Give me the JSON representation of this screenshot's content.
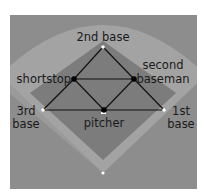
{
  "diagram": {
    "colors": {
      "page_background": "#ffffff",
      "panel_background": "#8d8d8d",
      "outfield_fan": "#a3a3a3",
      "infield_diamond": "#7a7a7a",
      "lines": "#111111",
      "base_marker": "#ffffff",
      "player_dot": "#000000",
      "label_text": "#1a1a1a"
    },
    "nodes": [
      {
        "id": "second_base",
        "label": "2nd base",
        "type": "base"
      },
      {
        "id": "shortstop",
        "label": "shortstop",
        "type": "player"
      },
      {
        "id": "second_baseman",
        "label_line1": "second",
        "label_line2": "baseman",
        "type": "player"
      },
      {
        "id": "third_base",
        "label_line1": "3rd",
        "label_line2": "base",
        "type": "base"
      },
      {
        "id": "first_base",
        "label_line1": "1st",
        "label_line2": "base",
        "type": "base"
      },
      {
        "id": "pitcher",
        "label": "pitcher",
        "type": "player"
      },
      {
        "id": "home_plate",
        "label": "",
        "type": "base"
      }
    ],
    "edges": [
      [
        "second_base",
        "shortstop"
      ],
      [
        "second_base",
        "second_baseman"
      ],
      [
        "shortstop",
        "second_baseman"
      ],
      [
        "shortstop",
        "third_base"
      ],
      [
        "shortstop",
        "pitcher"
      ],
      [
        "second_baseman",
        "pitcher"
      ],
      [
        "second_baseman",
        "first_base"
      ],
      [
        "third_base",
        "pitcher"
      ],
      [
        "pitcher",
        "first_base"
      ]
    ]
  }
}
